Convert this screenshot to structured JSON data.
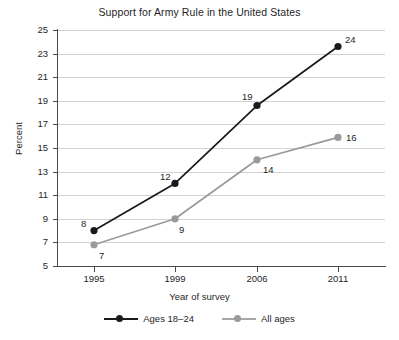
{
  "chart_data": {
    "type": "line",
    "title": "Support for Army Rule in the United States",
    "xlabel": "Year of survey",
    "ylabel": "Percent",
    "categories": [
      "1995",
      "1999",
      "2006",
      "2011"
    ],
    "ylim": [
      5,
      25
    ],
    "yticks": [
      5,
      7,
      9,
      11,
      13,
      15,
      17,
      19,
      21,
      23,
      25
    ],
    "grid": true,
    "legend_position": "bottom",
    "series": [
      {
        "name": "Ages 18–24",
        "color": "#1a1a1a",
        "values": [
          8,
          12,
          19,
          24
        ],
        "plot_values": [
          8.0,
          12.0,
          18.6,
          23.6
        ],
        "labels": [
          "8",
          "12",
          "19",
          "24"
        ]
      },
      {
        "name": "All ages",
        "color": "#9a9a9a",
        "values": [
          7,
          9,
          14,
          16
        ],
        "plot_values": [
          6.8,
          9.0,
          14.0,
          15.9
        ],
        "labels": [
          "7",
          "9",
          "14",
          "16"
        ]
      }
    ]
  },
  "axes": {
    "y_tick_labels": [
      "25",
      "23",
      "21",
      "19",
      "17",
      "15",
      "13",
      "11",
      "9",
      "7",
      "5"
    ],
    "x_tick_labels": [
      "1995",
      "1999",
      "2006",
      "2011"
    ]
  },
  "legend": {
    "entries": [
      {
        "label": "Ages 18–24"
      },
      {
        "label": "All ages"
      }
    ]
  }
}
